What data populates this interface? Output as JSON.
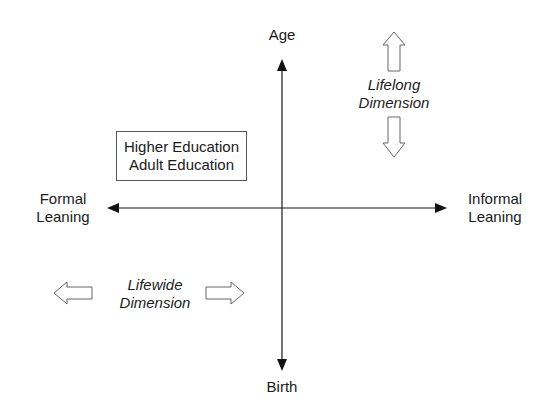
{
  "diagram": {
    "type": "quadrant-axes",
    "axes": {
      "vertical": {
        "top_label": "Age",
        "bottom_label": "Birth"
      },
      "horizontal": {
        "left_label": [
          "Formal",
          "Leaning"
        ],
        "right_label": [
          "Informal",
          "Leaning"
        ]
      }
    },
    "box": {
      "lines": [
        "Higher Education",
        "Adult Education"
      ]
    },
    "lifelong": {
      "lines": [
        "Lifelong",
        "Dimension"
      ],
      "arrows": [
        "up",
        "down"
      ]
    },
    "lifewide": {
      "lines": [
        "Lifewide",
        "Dimension"
      ],
      "arrows": [
        "left",
        "right"
      ]
    },
    "colors": {
      "line": "#1a1a1a",
      "hollow_arrow_stroke": "#666666",
      "background": "#ffffff"
    }
  }
}
